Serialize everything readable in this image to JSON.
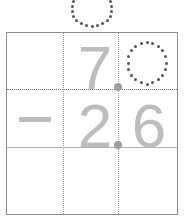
{
  "worksheet": {
    "type": "vertical-subtraction-decimal",
    "title": "Decimal subtraction tracing worksheet",
    "operator": "−",
    "carry_row": {
      "label": "answer-hint-above-grid",
      "digit": "0",
      "style": "dotted-trace",
      "clipped": true
    },
    "rows": [
      {
        "name": "minuend",
        "operator": "",
        "ones": "7",
        "decimal_point": ".",
        "tenths": "0",
        "tenths_style": "dotted-trace"
      },
      {
        "name": "subtrahend",
        "operator": "−",
        "ones": "2",
        "decimal_point": ".",
        "tenths": "6",
        "tenths_style": "solid-gray"
      },
      {
        "name": "difference",
        "operator": "",
        "ones": "",
        "decimal_point": "",
        "tenths": "",
        "tenths_style": "blank"
      }
    ],
    "expression": "7.0 − 2.6",
    "colors": {
      "digit_gray": "#bdbdbd",
      "dot_dark": "#555555",
      "decimal_dot": "#9e9e9e",
      "border": "#8d8d8d",
      "guide_dotted": "#9a9a9a",
      "rule_solid": "#b0b0b0",
      "background": "#ffffff"
    }
  }
}
